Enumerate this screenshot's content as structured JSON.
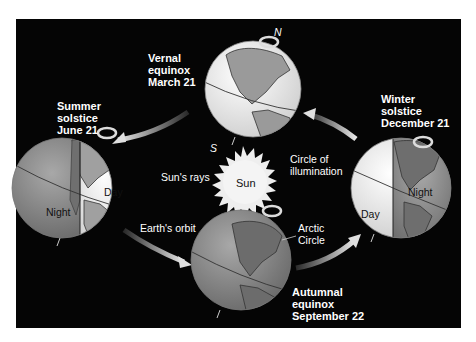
{
  "colors": {
    "background": "#050505",
    "page": "#ffffff",
    "globe_light": "#f2f2f2",
    "globe_dark": "#8c8c8c",
    "land_light": "#a9a9a9",
    "land_dark": "#6e6e6e",
    "sun": "#eeeeee",
    "arrow": "#d9d9d9",
    "text": "#ffffff"
  },
  "positions": {
    "vernal": {
      "line1": "Vernal",
      "line2": "equinox",
      "line3": "March 21"
    },
    "summer": {
      "line1": "Summer",
      "line2": "solstice",
      "line3": "June 21"
    },
    "winter": {
      "line1": "Winter",
      "line2": "solstice",
      "line3": "December 21"
    },
    "autumnal": {
      "line1": "Autumnal",
      "line2": "equinox",
      "line3": "September 22"
    }
  },
  "labels": {
    "sun": "Sun",
    "suns_rays": "Sun's rays",
    "circle_of_illumination_1": "Circle of",
    "circle_of_illumination_2": "illumination",
    "earths_orbit": "Earth's orbit",
    "arctic_circle_1": "Arctic",
    "arctic_circle_2": "Circle",
    "day": "Day",
    "night": "Night",
    "north": "N",
    "south": "S"
  }
}
